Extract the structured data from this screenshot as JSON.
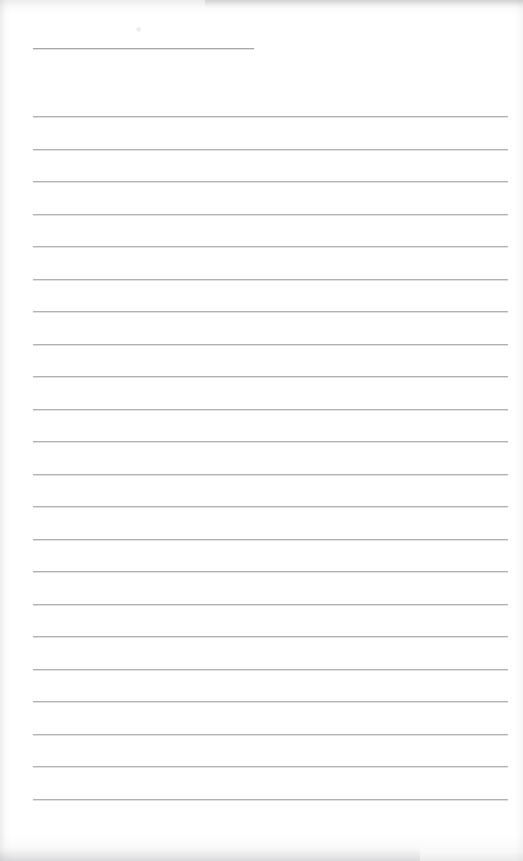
{
  "document": {
    "type": "lined-paper-scan",
    "title_text": "",
    "body_text": "",
    "page_background_color": "#ffffff",
    "rule_color": "#b2b2b6",
    "edge_artifact_color": "#b0b0b5"
  },
  "layout": {
    "page_width": 523,
    "page_height": 861,
    "rule_left_x": 33,
    "rule_right_x": 508,
    "title_rule": {
      "y": 48,
      "left_x": 33,
      "right_x": 254,
      "width": 221
    },
    "body_rules": {
      "first_y": 116,
      "spacing": 32.5,
      "count": 22,
      "last_y": 798,
      "width": 475
    }
  },
  "artifacts": {
    "top_band_height": 14,
    "bottom_band_height": 26,
    "left_band_width": 11,
    "right_band_width": 8,
    "speck": {
      "x": 135,
      "y": 26,
      "size": 7
    }
  },
  "accessibility": {
    "page_label": "Blank ruled notepad page",
    "title_rule_label": "Title or date write-on line",
    "body_rule_label": "Ruled writing line"
  }
}
